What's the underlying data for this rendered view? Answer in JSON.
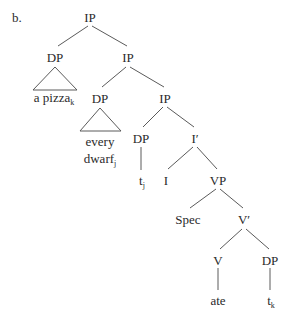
{
  "example_label": "b.",
  "nodes": {
    "ip_root": "IP",
    "dp_obj": "DP",
    "ip_2": "IP",
    "dp_subj": "DP",
    "ip_3": "IP",
    "dp_trace": "DP",
    "i_bar": "I′",
    "i_head": "I",
    "vp": "VP",
    "spec": "Spec",
    "v_bar": "V′",
    "v_head": "V",
    "dp_comp": "DP"
  },
  "leaves": {
    "a_pizza": {
      "text": "a pizza",
      "index": "k"
    },
    "every": {
      "text": "every"
    },
    "dwarf": {
      "text": "dwarf",
      "index": "j"
    },
    "trace_j": {
      "text": "t",
      "index": "j"
    },
    "ate": {
      "text": "ate"
    },
    "trace_k": {
      "text": "t",
      "index": "k"
    }
  },
  "colors": {
    "line": "#5a5a5a",
    "text": "#2a2a2a",
    "background": "#ffffff"
  }
}
